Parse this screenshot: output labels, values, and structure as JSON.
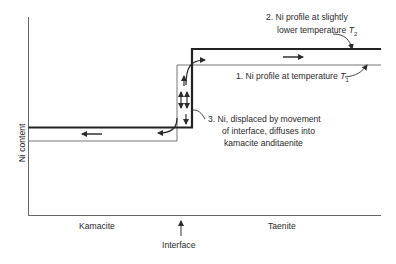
{
  "figure": {
    "y_axis_label": "Ni content",
    "x_regions": {
      "left": "Kamacite",
      "right": "Taenite",
      "boundary": "Interface"
    },
    "annotations": [
      {
        "number": "1.",
        "text": "Ni profile at temperature",
        "symbol": "T",
        "subscript": "1"
      },
      {
        "number": "2.",
        "line1": "Ni profile at slightly",
        "line2": "lower temperature",
        "symbol": "T",
        "subscript": "2"
      },
      {
        "number": "3.",
        "line1": "Ni, displaced by movement",
        "line2": "of interface, diffuses into",
        "line3": "kamacite anditaenite"
      }
    ],
    "profiles": [
      {
        "name": "T1 profile",
        "style": "thin",
        "low_y": 141,
        "high_y": 65,
        "step_x": 177
      },
      {
        "name": "T2 profile",
        "style": "thick",
        "low_y": 127,
        "high_y": 49,
        "step_x": 192
      }
    ],
    "colors": {
      "line": "#2b2b2b",
      "thin_line": "#777777",
      "text": "#2a2a2a"
    }
  }
}
